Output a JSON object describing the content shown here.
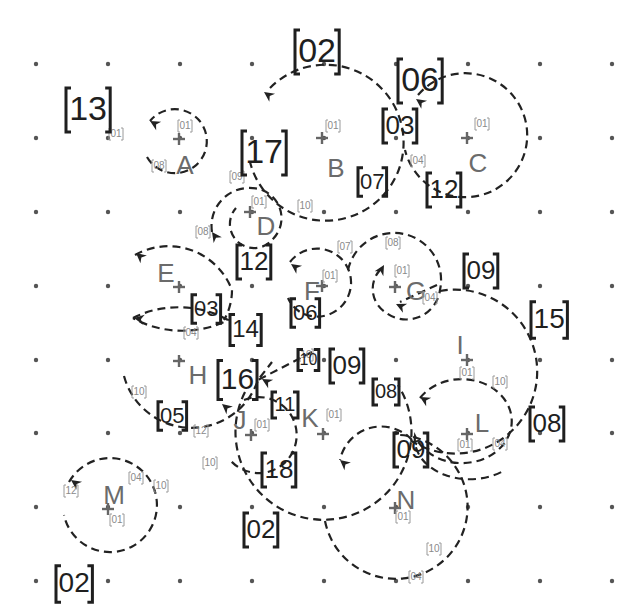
{
  "grid": {
    "xs": [
      36,
      108,
      180,
      252,
      324,
      396,
      468,
      540,
      612
    ],
    "ys": [
      64,
      138,
      212,
      286,
      360,
      433,
      507,
      581
    ],
    "dot_color": "#555555"
  },
  "nodes": [
    {
      "id": "A",
      "x": 179,
      "y": 139,
      "lx": 185,
      "ly": 167
    },
    {
      "id": "B",
      "x": 322,
      "y": 138,
      "lx": 336,
      "ly": 170
    },
    {
      "id": "C",
      "x": 467,
      "y": 138,
      "lx": 478,
      "ly": 165
    },
    {
      "id": "D",
      "x": 250,
      "y": 212,
      "lx": 266,
      "ly": 228
    },
    {
      "id": "E",
      "x": 179,
      "y": 287,
      "lx": 166,
      "ly": 275
    },
    {
      "id": "F",
      "x": 322,
      "y": 286,
      "lx": 312,
      "ly": 293
    },
    {
      "id": "G",
      "x": 395,
      "y": 287,
      "lx": 416,
      "ly": 293
    },
    {
      "id": "H",
      "x": 179,
      "y": 361,
      "lx": 198,
      "ly": 377
    },
    {
      "id": "I",
      "x": 467,
      "y": 360,
      "lx": 460,
      "ly": 347
    },
    {
      "id": "J",
      "x": 251,
      "y": 435,
      "lx": 240,
      "ly": 422
    },
    {
      "id": "K",
      "x": 323,
      "y": 434,
      "lx": 310,
      "ly": 420
    },
    {
      "id": "L",
      "x": 467,
      "y": 434,
      "lx": 482,
      "ly": 425
    },
    {
      "id": "M",
      "x": 108,
      "y": 509,
      "lx": 114,
      "ly": 497
    },
    {
      "id": "N",
      "x": 395,
      "y": 508,
      "lx": 406,
      "ly": 502
    }
  ],
  "small_tags": [
    {
      "text": "01",
      "x": 116,
      "y": 134
    },
    {
      "text": "01",
      "x": 185,
      "y": 126
    },
    {
      "text": "08",
      "x": 159,
      "y": 166
    },
    {
      "text": "01",
      "x": 333,
      "y": 126
    },
    {
      "text": "10",
      "x": 305,
      "y": 206
    },
    {
      "text": "01",
      "x": 482,
      "y": 124
    },
    {
      "text": "04",
      "x": 418,
      "y": 161
    },
    {
      "text": "09",
      "x": 237,
      "y": 177
    },
    {
      "text": "01",
      "x": 259,
      "y": 202
    },
    {
      "text": "08",
      "x": 203,
      "y": 232
    },
    {
      "text": "07",
      "x": 345,
      "y": 247
    },
    {
      "text": "08",
      "x": 393,
      "y": 243
    },
    {
      "text": "01",
      "x": 330,
      "y": 276
    },
    {
      "text": "01",
      "x": 402,
      "y": 271
    },
    {
      "text": "04",
      "x": 430,
      "y": 298
    },
    {
      "text": "04",
      "x": 191,
      "y": 333
    },
    {
      "text": "10",
      "x": 306,
      "y": 355
    },
    {
      "text": "10",
      "x": 139,
      "y": 392
    },
    {
      "text": "12",
      "x": 201,
      "y": 431
    },
    {
      "text": "01",
      "x": 262,
      "y": 425
    },
    {
      "text": "01",
      "x": 334,
      "y": 415
    },
    {
      "text": "01",
      "x": 467,
      "y": 373
    },
    {
      "text": "10",
      "x": 500,
      "y": 382
    },
    {
      "text": "01",
      "x": 465,
      "y": 445
    },
    {
      "text": "04",
      "x": 500,
      "y": 444
    },
    {
      "text": "10",
      "x": 210,
      "y": 463
    },
    {
      "text": "04",
      "x": 136,
      "y": 478
    },
    {
      "text": "10",
      "x": 161,
      "y": 486
    },
    {
      "text": "12",
      "x": 71,
      "y": 491
    },
    {
      "text": "01",
      "x": 117,
      "y": 520
    },
    {
      "text": "01",
      "x": 403,
      "y": 517
    },
    {
      "text": "10",
      "x": 434,
      "y": 549
    },
    {
      "text": "04",
      "x": 416,
      "y": 577
    }
  ],
  "big_tags": [
    {
      "text": "13",
      "x": 66,
      "y": 110,
      "size": 34
    },
    {
      "text": "02",
      "x": 295,
      "y": 52,
      "size": 34
    },
    {
      "text": "06",
      "x": 398,
      "y": 81,
      "size": 34
    },
    {
      "text": "17",
      "x": 242,
      "y": 153,
      "size": 34
    },
    {
      "text": "03",
      "x": 383,
      "y": 126,
      "size": 26
    },
    {
      "text": "07",
      "x": 358,
      "y": 182,
      "size": 22
    },
    {
      "text": "12",
      "x": 427,
      "y": 190,
      "size": 26
    },
    {
      "text": "12",
      "x": 237,
      "y": 262,
      "size": 26
    },
    {
      "text": "06",
      "x": 291,
      "y": 313,
      "size": 22
    },
    {
      "text": "09",
      "x": 464,
      "y": 271,
      "size": 26
    },
    {
      "text": "03",
      "x": 192,
      "y": 309,
      "size": 22
    },
    {
      "text": "14",
      "x": 230,
      "y": 330,
      "size": 24
    },
    {
      "text": "15",
      "x": 531,
      "y": 320,
      "size": 28
    },
    {
      "text": "16",
      "x": 218,
      "y": 380,
      "size": 30
    },
    {
      "text": "10",
      "x": 298,
      "y": 360,
      "size": 16
    },
    {
      "text": "09",
      "x": 330,
      "y": 366,
      "size": 26
    },
    {
      "text": "05",
      "x": 158,
      "y": 416,
      "size": 22
    },
    {
      "text": "08",
      "x": 373,
      "y": 392,
      "size": 20
    },
    {
      "text": "11",
      "x": 272,
      "y": 405,
      "size": 20
    },
    {
      "text": "08",
      "x": 530,
      "y": 424,
      "size": 26
    },
    {
      "text": "09",
      "x": 394,
      "y": 450,
      "size": 26
    },
    {
      "text": "18",
      "x": 262,
      "y": 470,
      "size": 26
    },
    {
      "text": "02",
      "x": 244,
      "y": 530,
      "size": 26
    },
    {
      "text": "02",
      "x": 56,
      "y": 584,
      "size": 28
    }
  ],
  "arcs": [
    {
      "name": "arc-A",
      "d": "M 147 157 A 32 32 0 1 0 150 121",
      "arrow": {
        "x": 150,
        "y": 121,
        "angle": 210
      }
    },
    {
      "name": "arc-B",
      "d": "M 270 88 A 78 78 0 1 1 250 162",
      "arrow": {
        "x": 264,
        "y": 92,
        "angle": 215
      }
    },
    {
      "name": "arc-C",
      "d": "M 418 95 A 62 62 0 1 1 405 150",
      "arrow": {
        "x": 416,
        "y": 99,
        "angle": 215
      }
    },
    {
      "name": "arc-D",
      "d": "M 212 232 A 38 38 0 0 1 262 190 A 30 30 0 0 1 272 240 A 22 22 0 0 1 236 208",
      "arrow": {
        "x": 212,
        "y": 232,
        "angle": 235
      }
    },
    {
      "name": "arc-E",
      "d": "M 135 255 A 68 68 0 0 1 232 290 A 60 60 0 0 1 224 320",
      "arrow": {
        "x": 136,
        "y": 253,
        "angle": 220
      }
    },
    {
      "name": "arc-E2",
      "d": "M 133 318 A 80 60 0 0 1 228 320 A 80 60 0 0 1 133 318",
      "arrow": {
        "x": 134,
        "y": 318,
        "angle": 190
      }
    },
    {
      "name": "arc-F",
      "d": "M 290 262 A 34 34 0 1 1 300 312 A 32 32 0 0 1 288 298",
      "arrow": {
        "x": 291,
        "y": 264,
        "angle": 215
      }
    },
    {
      "name": "arc-G",
      "d": "M 348 270 A 44 44 0 0 1 440 290 A 34 34 0 0 1 385 312 A 28 28 0 0 1 382 268",
      "arrow": {
        "x": 384,
        "y": 265,
        "angle": 300
      }
    },
    {
      "name": "arc-G2",
      "d": "M 437 285 L 400 302",
      "arrow": {
        "x": 396,
        "y": 304,
        "angle": 205
      }
    },
    {
      "name": "arc-I",
      "d": "M 440 291 A 82 82 0 1 1 410 440",
      "arrow": null
    },
    {
      "name": "arc-H",
      "d": "M 124 376 A 70 70 0 0 0 258 380 L 272 362",
      "arrow": {
        "x": 222,
        "y": 404,
        "angle": 220
      }
    },
    {
      "name": "arc-H2",
      "d": "M 312 352 L 258 380",
      "arrow": {
        "x": 262,
        "y": 379,
        "angle": 210
      }
    },
    {
      "name": "arc-J",
      "d": "M 244 400 A 38 38 0 1 1 230 460",
      "arrow": null
    },
    {
      "name": "arc-K",
      "d": "M 245 392 A 88 88 0 1 0 398 385",
      "arrow": null
    },
    {
      "name": "arc-L",
      "d": "M 420 398 A 50 42 0 1 1 415 436 A 55 40 0 0 0 505 470",
      "arrow": {
        "x": 420,
        "y": 397,
        "angle": 210
      }
    },
    {
      "name": "arc-N",
      "d": "M 412 440 A 42 42 0 0 0 340 460",
      "arrow": {
        "x": 340,
        "y": 460,
        "angle": 220
      }
    },
    {
      "name": "arc-N2",
      "d": "M 325 521 A 72 72 0 1 0 400 435",
      "arrow": null
    },
    {
      "name": "arc-M",
      "d": "M 69 482 A 47 47 0 1 1 64 515",
      "arrow": {
        "x": 71,
        "y": 480,
        "angle": 215
      }
    }
  ]
}
